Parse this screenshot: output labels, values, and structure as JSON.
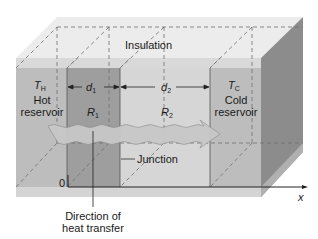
{
  "diagram": {
    "insulation_label": "Insulation",
    "hot": {
      "symbol": "T",
      "subscript": "H",
      "line1": "Hot",
      "line2": "reservoir"
    },
    "cold": {
      "symbol": "T",
      "subscript": "C",
      "line1": "Cold",
      "line2": "reservoir"
    },
    "slab1": {
      "thickness_symbol": "d",
      "thickness_sub": "1",
      "resistance_symbol": "R",
      "resistance_sub": "1"
    },
    "slab2": {
      "thickness_symbol": "d",
      "thickness_sub": "2",
      "resistance_symbol": "R",
      "resistance_sub": "2"
    },
    "junction_label": "Junction",
    "origin_label": "0",
    "axis_label": "x",
    "direction_line1": "Direction of",
    "direction_line2": "heat transfer"
  },
  "colors": {
    "top_face": "#ececec",
    "insulation_band": "#d9d9d9",
    "hot_face": "#bdbdbd",
    "slab1_face": "#9e9e9e",
    "slab2_face": "#d6d6d6",
    "cold_face": "#bdbdbd",
    "side_face": "#8c8c8c",
    "arrow_fill": "#c8c8c8",
    "bottom_strip": "#d4d4d4",
    "line": "#333333",
    "dash": "#6e6e6e"
  }
}
